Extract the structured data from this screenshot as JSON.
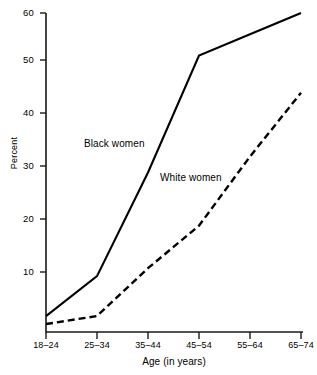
{
  "chart_data": {
    "type": "line",
    "title": "",
    "subtitle": "",
    "xlabel": "Age (in years)",
    "ylabel": "Percent",
    "categories": [
      "18–24",
      "25–34",
      "35–44",
      "45–54",
      "55–64",
      "65–74"
    ],
    "ylim": [
      0,
      60
    ],
    "yticks": [
      10,
      20,
      30,
      40,
      50,
      60
    ],
    "ytick_labels": [
      "10",
      "20",
      "30",
      "40",
      "50",
      "60"
    ],
    "grid": false,
    "legend_position": "inline-annotations",
    "series": [
      {
        "name": "Black women",
        "style": "solid",
        "color": "#000000",
        "values": [
          3,
          10.5,
          30,
          52,
          56,
          60
        ]
      },
      {
        "name": "White women",
        "style": "dashed",
        "color": "#000000",
        "values": [
          1.5,
          3,
          12,
          20,
          33,
          45
        ]
      }
    ],
    "annotations": [
      {
        "text": "Black women",
        "series": "Black women"
      },
      {
        "text": "White women",
        "series": "White women"
      }
    ]
  },
  "axis": {
    "y_title": "Percent",
    "x_title": "Age (in years)"
  },
  "colors": {
    "axis": "#1a1a1a",
    "line": "#000000",
    "background": "#ffffff"
  }
}
